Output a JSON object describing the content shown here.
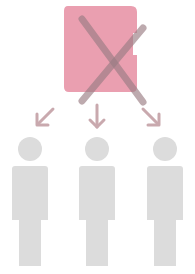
{
  "diagram": {
    "document": {
      "icon": "document-icon",
      "color": "#ea9fb0",
      "crossed_out": true
    },
    "cross": {
      "icon": "cross-icon",
      "color": "#9a7d84"
    },
    "arrows": [
      {
        "icon": "arrow-down-left-icon",
        "color": "#c9a9ae"
      },
      {
        "icon": "arrow-down-icon",
        "color": "#c9a9ae"
      },
      {
        "icon": "arrow-down-right-icon",
        "color": "#c9a9ae"
      }
    ],
    "people": [
      {
        "icon": "person-icon",
        "color": "#dcdcdc"
      },
      {
        "icon": "person-icon",
        "color": "#dcdcdc"
      },
      {
        "icon": "person-icon",
        "color": "#dcdcdc"
      }
    ]
  }
}
